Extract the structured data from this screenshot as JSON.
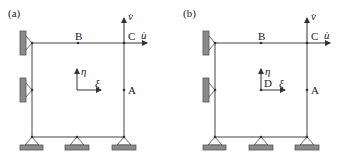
{
  "panels": [
    {
      "id": "a",
      "label": "(a)",
      "points": {
        "B": "B",
        "C": "C",
        "A": "A"
      },
      "velocity_labels": {
        "v_dot": "v̇",
        "u_dot": "u̇"
      },
      "local_axes": {
        "eta": "η",
        "xi": "ξ",
        "origin_label": ""
      }
    },
    {
      "id": "b",
      "label": "(b)",
      "points": {
        "B": "B",
        "C": "C",
        "A": "A"
      },
      "velocity_labels": {
        "v_dot": "v̇",
        "u_dot": "u̇"
      },
      "local_axes": {
        "eta": "η",
        "xi": "ξ",
        "origin_label": "D"
      }
    }
  ],
  "colors": {
    "line": "#444444",
    "support_fill": "#8a8a8a"
  }
}
